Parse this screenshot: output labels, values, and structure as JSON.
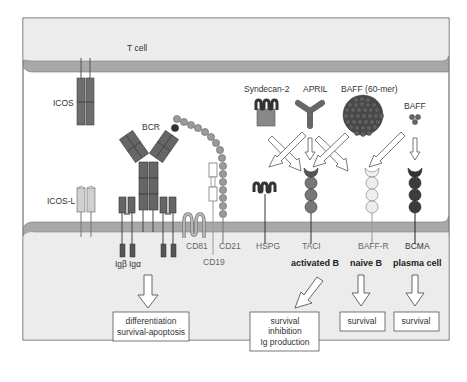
{
  "cells": {
    "t_cell": "T cell"
  },
  "molecules": {
    "icos": "ICOS",
    "icos_l": "ICOS-L",
    "bcr": "BCR",
    "ig_beta": "Igβ",
    "ig_alpha": "Igα",
    "cd81": "CD81",
    "cd19": "CD19",
    "cd21": "CD21",
    "syndecan2": "Syndecan-2",
    "april": "APRIL",
    "baff60": "BAFF (60-mer)",
    "baff": "BAFF",
    "hspg": "HSPG",
    "taci": "TACI",
    "baffr": "BAFF-R",
    "bcma": "BCMA"
  },
  "cell_types": {
    "activated_b": "activated B",
    "naive_b": "naive B",
    "plasma_cell": "plasma cell"
  },
  "outcomes": {
    "bcr_line1": "differentiation",
    "bcr_line2": "survival-apoptosis",
    "taci_line1": "survival",
    "taci_line2": "inhibition",
    "taci_line3": "Ig production",
    "baffr": "survival",
    "bcma": "survival"
  },
  "colors": {
    "membrane": "#a8a8a8",
    "cytoplasm": "#ececec",
    "receptor_dark": "#5a5a5a",
    "receptor_mid": "#7d7d7d",
    "receptor_light": "#dcdcdc",
    "cd21": "#9a9a9a"
  }
}
